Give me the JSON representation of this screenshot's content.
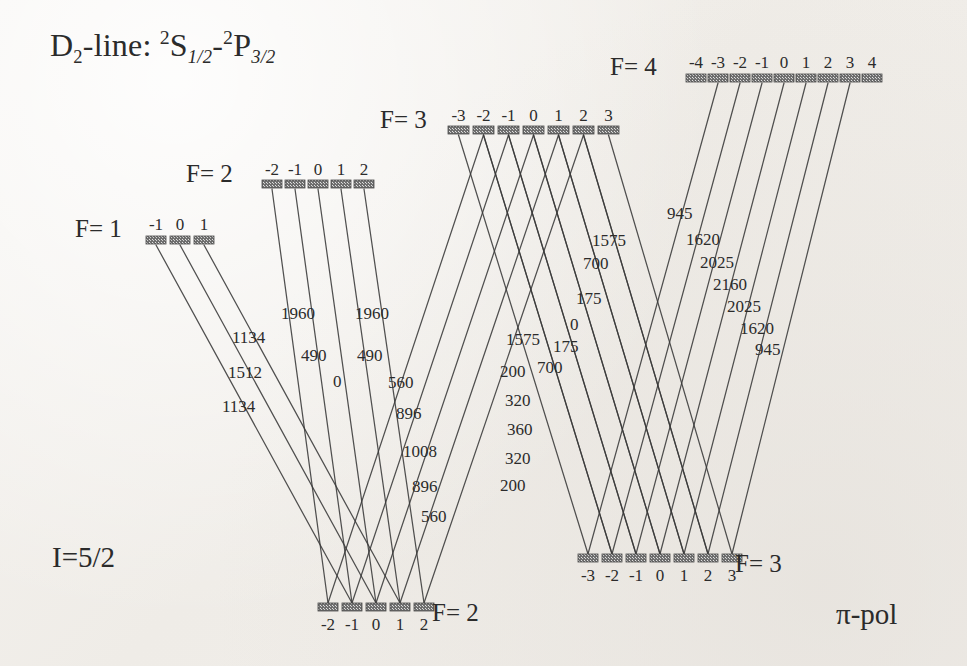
{
  "figure": {
    "title_prefix": "D",
    "title_sub": "2",
    "title_mid": "-line: ",
    "title_term_lower_sup": "2",
    "title_term_lower": "S",
    "title_term_lower_sub": "1/2",
    "title_dash": "-",
    "title_term_upper_sup": "2",
    "title_term_upper": "P",
    "title_term_upper_sub": "3/2",
    "nuclear_spin": "I=5/2",
    "polarization": "π-pol",
    "ink_color": "#3a3a3a",
    "bar_color": "#6f6f6f"
  },
  "levels": [
    {
      "id": "upper-f1",
      "name": "F= 1",
      "role": "upper",
      "y": 240,
      "label_x": 75,
      "label_y": 216,
      "m_label_y": 216,
      "m_labels": [
        "-1",
        "0",
        "1"
      ],
      "bars": [
        {
          "m": "-1",
          "x": 146,
          "w": 20
        },
        {
          "m": "0",
          "x": 170,
          "w": 20
        },
        {
          "m": "1",
          "x": 194,
          "w": 20
        }
      ]
    },
    {
      "id": "upper-f2",
      "name": "F= 2",
      "role": "upper",
      "y": 184,
      "label_x": 186,
      "label_y": 161,
      "m_label_y": 161,
      "m_labels": [
        "-2",
        "-1",
        "0",
        "1",
        "2"
      ],
      "bars": [
        {
          "m": "-2",
          "x": 262,
          "w": 20
        },
        {
          "m": "-1",
          "x": 285,
          "w": 20
        },
        {
          "m": "0",
          "x": 308,
          "w": 20
        },
        {
          "m": "1",
          "x": 331,
          "w": 20
        },
        {
          "m": "2",
          "x": 354,
          "w": 20
        }
      ]
    },
    {
      "id": "upper-f3",
      "name": "F= 3",
      "role": "upper",
      "y": 130,
      "label_x": 380,
      "label_y": 107,
      "m_label_y": 107,
      "m_labels": [
        "-3",
        "-2",
        "-1",
        "0",
        "1",
        "2",
        "3"
      ],
      "bars": [
        {
          "m": "-3",
          "x": 448,
          "w": 21
        },
        {
          "m": "-2",
          "x": 473,
          "w": 21
        },
        {
          "m": "-1",
          "x": 498,
          "w": 21
        },
        {
          "m": "0",
          "x": 523,
          "w": 21
        },
        {
          "m": "1",
          "x": 548,
          "w": 21
        },
        {
          "m": "2",
          "x": 573,
          "w": 21
        },
        {
          "m": "3",
          "x": 598,
          "w": 21
        }
      ]
    },
    {
      "id": "upper-f4",
      "name": "F= 4",
      "role": "upper",
      "y": 78,
      "label_x": 610,
      "label_y": 54,
      "m_label_y": 54,
      "m_labels": [
        "-4",
        "-3",
        "-2",
        "-1",
        "0",
        "1",
        "2",
        "3",
        "4"
      ],
      "bars": [
        {
          "m": "-4",
          "x": 686,
          "w": 20
        },
        {
          "m": "-3",
          "x": 708,
          "w": 20
        },
        {
          "m": "-2",
          "x": 730,
          "w": 20
        },
        {
          "m": "-1",
          "x": 752,
          "w": 20
        },
        {
          "m": "0",
          "x": 774,
          "w": 20
        },
        {
          "m": "1",
          "x": 796,
          "w": 20
        },
        {
          "m": "2",
          "x": 818,
          "w": 20
        },
        {
          "m": "3",
          "x": 840,
          "w": 20
        },
        {
          "m": "4",
          "x": 862,
          "w": 20
        }
      ]
    },
    {
      "id": "lower-f2",
      "name": "F= 2",
      "role": "lower",
      "y": 607,
      "label_x": 432,
      "label_y": 600,
      "m_label_y": 616,
      "m_labels": [
        "-2",
        "-1",
        "0",
        "1",
        "2"
      ],
      "bars": [
        {
          "m": "-2",
          "x": 318,
          "w": 20
        },
        {
          "m": "-1",
          "x": 342,
          "w": 20
        },
        {
          "m": "0",
          "x": 366,
          "w": 20
        },
        {
          "m": "1",
          "x": 390,
          "w": 20
        },
        {
          "m": "2",
          "x": 414,
          "w": 20
        }
      ]
    },
    {
      "id": "lower-f3",
      "name": "F= 3",
      "role": "lower",
      "y": 558,
      "label_x": 735,
      "label_y": 551,
      "m_label_y": 567,
      "m_labels": [
        "-3",
        "-2",
        "-1",
        "0",
        "1",
        "2",
        "3"
      ],
      "bars": [
        {
          "m": "-3",
          "x": 578,
          "w": 20
        },
        {
          "m": "-2",
          "x": 602,
          "w": 20
        },
        {
          "m": "-1",
          "x": 626,
          "w": 20
        },
        {
          "m": "0",
          "x": 650,
          "w": 20
        },
        {
          "m": "1",
          "x": 674,
          "w": 20
        },
        {
          "m": "2",
          "x": 698,
          "w": 20
        },
        {
          "m": "3",
          "x": 722,
          "w": 20
        }
      ]
    }
  ],
  "transitions": [
    {
      "id": "f1-to-f2",
      "from": "upper-f1",
      "to": "lower-f2",
      "strengths": [
        "1134",
        "1512",
        "1134"
      ],
      "pairs": [
        {
          "from_m": "-1",
          "to_m": "-1",
          "strength": "1134",
          "label_x": 232,
          "label_y": 329
        },
        {
          "from_m": "0",
          "to_m": "0",
          "strength": "1512",
          "label_x": 228,
          "label_y": 364
        },
        {
          "from_m": "1",
          "to_m": "1",
          "strength": "1134",
          "label_x": 222,
          "label_y": 398
        }
      ]
    },
    {
      "id": "f2-to-f2",
      "from": "upper-f2",
      "to": "lower-f2",
      "strengths": [
        "1960",
        "490",
        "0",
        "490",
        "1960"
      ],
      "pairs": [
        {
          "from_m": "-2",
          "to_m": "-2",
          "strength": "1960",
          "label_x": 281,
          "label_y": 305
        },
        {
          "from_m": "-1",
          "to_m": "-1",
          "strength": "490",
          "label_x": 301,
          "label_y": 347
        },
        {
          "from_m": "0",
          "to_m": "0",
          "strength": "0",
          "label_x": 333,
          "label_y": 373
        },
        {
          "from_m": "1",
          "to_m": "1",
          "strength": "490",
          "label_x": 357,
          "label_y": 347
        },
        {
          "from_m": "2",
          "to_m": "2",
          "strength": "1960",
          "label_x": 355,
          "label_y": 305
        }
      ]
    },
    {
      "id": "f3-to-f2",
      "from": "upper-f3",
      "to": "lower-f2",
      "strengths": [
        "560",
        "896",
        "1008",
        "896",
        "560"
      ],
      "pairs": [
        {
          "from_m": "-2",
          "to_m": "-2",
          "strength": "560",
          "label_x": 388,
          "label_y": 374
        },
        {
          "from_m": "-1",
          "to_m": "-1",
          "strength": "896",
          "label_x": 396,
          "label_y": 405
        },
        {
          "from_m": "0",
          "to_m": "0",
          "strength": "1008",
          "label_x": 403,
          "label_y": 443
        },
        {
          "from_m": "1",
          "to_m": "1",
          "strength": "896",
          "label_x": 412,
          "label_y": 478
        },
        {
          "from_m": "2",
          "to_m": "2",
          "strength": "560",
          "label_x": 421,
          "label_y": 508
        }
      ]
    },
    {
      "id": "f3-to-f3",
      "from": "upper-f3",
      "to": "lower-f3",
      "strengths": [
        "1575",
        "700",
        "175",
        "0",
        "175",
        "700",
        "1575"
      ],
      "pairs": [
        {
          "from_m": "-3",
          "to_m": "-3",
          "strength": "1575",
          "label_x": 506,
          "label_y": 331
        },
        {
          "from_m": "-2",
          "to_m": "-2",
          "strength": "700",
          "label_x": 537,
          "label_y": 359
        },
        {
          "from_m": "-1",
          "to_m": "-1",
          "strength": "175",
          "label_x": 553,
          "label_y": 338
        },
        {
          "from_m": "0",
          "to_m": "0",
          "strength": "0",
          "label_x": 570,
          "label_y": 316
        },
        {
          "from_m": "1",
          "to_m": "1",
          "strength": "175",
          "label_x": 576,
          "label_y": 290
        },
        {
          "from_m": "2",
          "to_m": "2",
          "strength": "700",
          "label_x": 583,
          "label_y": 255
        },
        {
          "from_m": "3",
          "to_m": "3",
          "strength": "1575",
          "label_x": 592,
          "label_y": 232
        }
      ]
    },
    {
      "id": "f3-to-f3-inner",
      "from": "upper-f3",
      "to": "lower-f3",
      "strengths": [
        "200",
        "320",
        "360",
        "320",
        "200"
      ],
      "pairs": [
        {
          "from_m": "-2",
          "to_m": "-2",
          "strength": "200",
          "label_x": 500,
          "label_y": 363
        },
        {
          "from_m": "-1",
          "to_m": "-1",
          "strength": "320",
          "label_x": 505,
          "label_y": 392
        },
        {
          "from_m": "0",
          "to_m": "0",
          "strength": "360",
          "label_x": 507,
          "label_y": 421
        },
        {
          "from_m": "1",
          "to_m": "1",
          "strength": "320",
          "label_x": 505,
          "label_y": 450
        },
        {
          "from_m": "2",
          "to_m": "2",
          "strength": "200",
          "label_x": 500,
          "label_y": 477
        }
      ]
    },
    {
      "id": "f4-to-f3",
      "from": "upper-f4",
      "to": "lower-f3",
      "strengths": [
        "945",
        "1620",
        "2025",
        "2160",
        "2025",
        "1620",
        "945"
      ],
      "pairs": [
        {
          "from_m": "-3",
          "to_m": "-3",
          "strength": "945",
          "label_x": 667,
          "label_y": 205
        },
        {
          "from_m": "-2",
          "to_m": "-2",
          "strength": "1620",
          "label_x": 686,
          "label_y": 231
        },
        {
          "from_m": "-1",
          "to_m": "-1",
          "strength": "2025",
          "label_x": 700,
          "label_y": 254
        },
        {
          "from_m": "0",
          "to_m": "0",
          "strength": "2160",
          "label_x": 713,
          "label_y": 276
        },
        {
          "from_m": "1",
          "to_m": "1",
          "strength": "2025",
          "label_x": 727,
          "label_y": 298
        },
        {
          "from_m": "2",
          "to_m": "2",
          "strength": "1620",
          "label_x": 740,
          "label_y": 320
        },
        {
          "from_m": "3",
          "to_m": "3",
          "strength": "945",
          "label_x": 755,
          "label_y": 341
        }
      ]
    }
  ]
}
